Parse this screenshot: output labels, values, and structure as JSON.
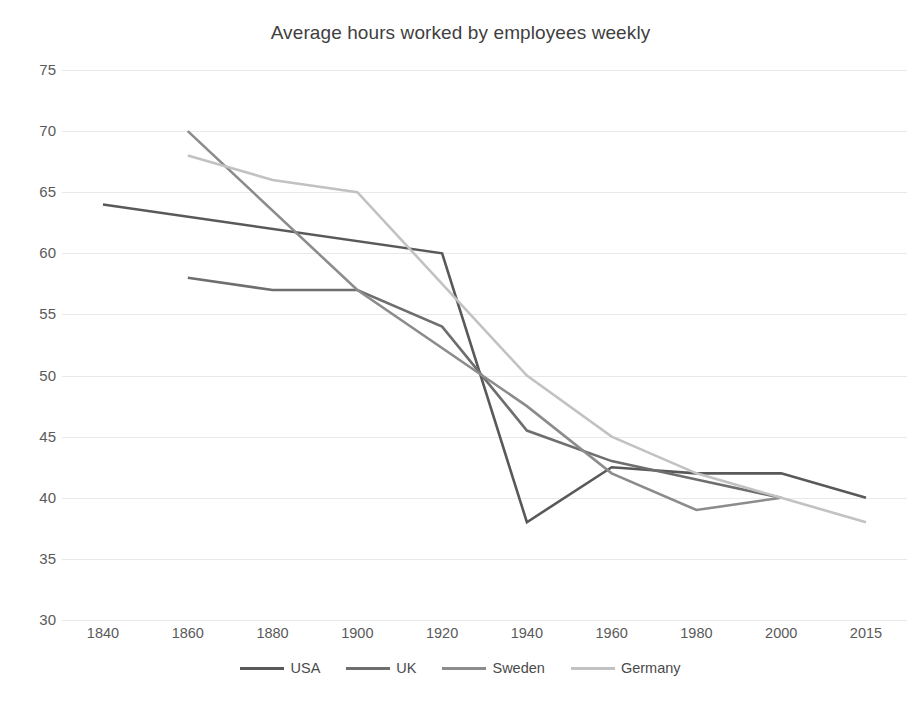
{
  "chart_data": {
    "type": "line",
    "title": "Average hours worked by employees weekly",
    "xlabel": "",
    "ylabel": "",
    "x": [
      1840,
      1860,
      1880,
      1900,
      1920,
      1940,
      1960,
      1980,
      2000,
      2015
    ],
    "xtick_labels": [
      "1840",
      "1860",
      "1880",
      "1900",
      "1920",
      "1940",
      "1960",
      "1980",
      "2000",
      "2015"
    ],
    "ytick_labels": [
      "75",
      "70",
      "65",
      "60",
      "55",
      "50",
      "45",
      "40",
      "35",
      "30"
    ],
    "ylim": [
      30,
      75
    ],
    "ytick_step": 5,
    "grid": true,
    "legend_position": "bottom",
    "series": [
      {
        "name": "USA",
        "color": "#595959",
        "points": [
          {
            "x": 1840,
            "y": 64
          },
          {
            "x": 1920,
            "y": 60
          },
          {
            "x": 1940,
            "y": 38
          },
          {
            "x": 1960,
            "y": 42.5
          },
          {
            "x": 1980,
            "y": 42
          },
          {
            "x": 2000,
            "y": 42
          },
          {
            "x": 2015,
            "y": 40
          }
        ]
      },
      {
        "name": "UK",
        "color": "#6e6e6e",
        "points": [
          {
            "x": 1860,
            "y": 58
          },
          {
            "x": 1880,
            "y": 57
          },
          {
            "x": 1900,
            "y": 57
          },
          {
            "x": 1920,
            "y": 54
          },
          {
            "x": 1940,
            "y": 45.5
          },
          {
            "x": 1960,
            "y": 43
          },
          {
            "x": 1980,
            "y": 41.5
          },
          {
            "x": 2000,
            "y": 40
          }
        ]
      },
      {
        "name": "Sweden",
        "color": "#8c8c8c",
        "points": [
          {
            "x": 1860,
            "y": 70
          },
          {
            "x": 1900,
            "y": 57
          },
          {
            "x": 1940,
            "y": 47.5
          },
          {
            "x": 1960,
            "y": 42
          },
          {
            "x": 1980,
            "y": 39
          },
          {
            "x": 2000,
            "y": 40
          }
        ]
      },
      {
        "name": "Germany",
        "color": "#c2c2c2",
        "points": [
          {
            "x": 1860,
            "y": 68
          },
          {
            "x": 1880,
            "y": 66
          },
          {
            "x": 1900,
            "y": 65
          },
          {
            "x": 1940,
            "y": 50
          },
          {
            "x": 1960,
            "y": 45
          },
          {
            "x": 1980,
            "y": 42
          },
          {
            "x": 2000,
            "y": 40
          },
          {
            "x": 2015,
            "y": 38
          }
        ]
      }
    ]
  },
  "legend": {
    "items": [
      {
        "label": "USA",
        "color": "#595959"
      },
      {
        "label": "UK",
        "color": "#6e6e6e"
      },
      {
        "label": "Sweden",
        "color": "#8c8c8c"
      },
      {
        "label": "Germany",
        "color": "#c2c2c2"
      }
    ]
  }
}
